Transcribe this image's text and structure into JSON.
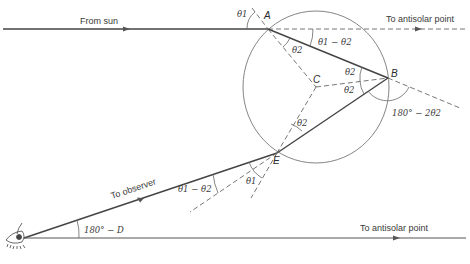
{
  "diagram": {
    "type": "rainbow ray geometry (primary bow) in a spherical raindrop",
    "labels": {
      "from_sun": "From sun",
      "to_antisolar_top": "To antisolar point",
      "to_antisolar_bottom": "To antisolar point",
      "to_observer": "To observer"
    },
    "points": {
      "A": "A",
      "B": "B",
      "C": "C",
      "E": "E"
    },
    "angles": {
      "theta1_at_A": "θ1",
      "theta1_minus_theta2_at_A": "θ1 − θ2",
      "theta2_at_A": "θ2",
      "theta2_at_B_upper": "θ2",
      "theta2_at_B_lower": "θ2",
      "deflection_at_B": "180° − 2θ2",
      "theta2_at_E": "θ2",
      "theta1_at_E": "θ1",
      "theta1_minus_theta2_at_E": "θ1 − θ2",
      "observer_angle": "180° − D"
    },
    "colors": {
      "line": "#555555",
      "text": "#3a3a3a",
      "background": "#ffffff"
    }
  }
}
